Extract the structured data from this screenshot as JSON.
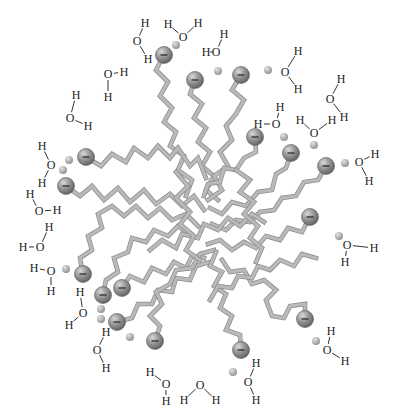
{
  "diagram": {
    "colors": {
      "background": "#ffffff",
      "chain_fill": "#b9b9b9",
      "chain_edge": "#8a8a8a",
      "headgroup": "#8c8c8c",
      "counterion": "#a8a8a8",
      "text": "#222222"
    },
    "labels": {
      "hydrogen": "H",
      "oxygen": "O",
      "charge": "−"
    },
    "headgroups": [
      {
        "x": 164,
        "y": 55
      },
      {
        "x": 195,
        "y": 80
      },
      {
        "x": 241,
        "y": 75
      },
      {
        "x": 86,
        "y": 157
      },
      {
        "x": 66,
        "y": 186
      },
      {
        "x": 255,
        "y": 137
      },
      {
        "x": 291,
        "y": 153
      },
      {
        "x": 326,
        "y": 166
      },
      {
        "x": 310,
        "y": 217
      },
      {
        "x": 83,
        "y": 274
      },
      {
        "x": 103,
        "y": 295
      },
      {
        "x": 122,
        "y": 288
      },
      {
        "x": 117,
        "y": 322
      },
      {
        "x": 155,
        "y": 341
      },
      {
        "x": 241,
        "y": 350
      },
      {
        "x": 305,
        "y": 319
      }
    ],
    "counterions": [
      {
        "x": 176,
        "y": 45
      },
      {
        "x": 218,
        "y": 71
      },
      {
        "x": 268,
        "y": 70
      },
      {
        "x": 69,
        "y": 160
      },
      {
        "x": 63,
        "y": 170
      },
      {
        "x": 284,
        "y": 137
      },
      {
        "x": 314,
        "y": 145
      },
      {
        "x": 345,
        "y": 163
      },
      {
        "x": 339,
        "y": 236
      },
      {
        "x": 66,
        "y": 269
      },
      {
        "x": 101,
        "y": 309
      },
      {
        "x": 101,
        "y": 319
      },
      {
        "x": 130,
        "y": 337
      },
      {
        "x": 233,
        "y": 372
      },
      {
        "x": 316,
        "y": 341
      }
    ],
    "waters": [
      {
        "o": [
          137,
          41
        ],
        "h1": [
          145,
          23
        ],
        "h2": [
          148,
          59
        ]
      },
      {
        "o": [
          183,
          37
        ],
        "h1": [
          168,
          24
        ],
        "h2": [
          198,
          23
        ]
      },
      {
        "o": [
          216,
          52
        ],
        "h1": [
          206,
          52
        ],
        "h2": [
          224,
          34
        ]
      },
      {
        "o": [
          108,
          74
        ],
        "h1": [
          124,
          72
        ],
        "h2": [
          108,
          97
        ]
      },
      {
        "o": [
          285,
          72
        ],
        "h1": [
          298,
          51
        ],
        "h2": [
          298,
          89
        ]
      },
      {
        "o": [
          70,
          118
        ],
        "h1": [
          76,
          95
        ],
        "h2": [
          88,
          126
        ]
      },
      {
        "o": [
          330,
          99
        ],
        "h1": [
          341,
          79
        ],
        "h2": [
          344,
          117
        ]
      },
      {
        "o": [
          276,
          124
        ],
        "h1": [
          280,
          107
        ],
        "h2": [
          258,
          124
        ]
      },
      {
        "o": [
          314,
          133
        ],
        "h1": [
          300,
          120
        ],
        "h2": [
          332,
          120
        ]
      },
      {
        "o": [
          51,
          165
        ],
        "h1": [
          42,
          146
        ],
        "h2": [
          42,
          183
        ]
      },
      {
        "o": [
          359,
          162
        ],
        "h1": [
          375,
          154
        ],
        "h2": [
          369,
          181
        ]
      },
      {
        "o": [
          39,
          211
        ],
        "h1": [
          30,
          194
        ],
        "h2": [
          57,
          210
        ]
      },
      {
        "o": [
          40,
          247
        ],
        "h1": [
          49,
          227
        ],
        "h2": [
          23,
          247
        ]
      },
      {
        "o": [
          347,
          245
        ],
        "h1": [
          374,
          248
        ],
        "h2": [
          345,
          262
        ]
      },
      {
        "o": [
          51,
          271
        ],
        "h1": [
          34,
          268
        ],
        "h2": [
          51,
          291
        ]
      },
      {
        "o": [
          83,
          313
        ],
        "h1": [
          80,
          292
        ],
        "h2": [
          69,
          325
        ]
      },
      {
        "o": [
          97,
          350
        ],
        "h1": [
          106,
          332
        ],
        "h2": [
          106,
          368
        ]
      },
      {
        "o": [
          327,
          350
        ],
        "h1": [
          331,
          331
        ],
        "h2": [
          345,
          361
        ]
      },
      {
        "o": [
          166,
          384
        ],
        "h1": [
          150,
          372
        ],
        "h2": [
          166,
          401
        ]
      },
      {
        "o": [
          200,
          385
        ],
        "h1": [
          184,
          400
        ],
        "h2": [
          216,
          400
        ]
      },
      {
        "o": [
          248,
          382
        ],
        "h1": [
          256,
          363
        ],
        "h2": [
          256,
          400
        ]
      }
    ],
    "chains": [
      "M164,55 L156,70 L168,82 L160,96 L172,108 L164,122 L176,132 L170,146 L184,156 L178,170 L192,180 L186,196",
      "M195,80 L190,94 L202,104 L194,118 L206,128 L198,142 L210,152 L202,166 L214,176 L206,190 L218,200",
      "M241,75 L232,90 L244,100 L236,114 L226,126 L232,140 L220,152 L228,166 L214,176 L222,190 L208,200",
      "M86,157 L101,166 L112,154 L126,162 L134,148 L148,158 L158,146 L170,158 L178,148 L190,166 L198,158 L206,178",
      "M66,186 L80,196 L92,186 L104,200 L118,188 L130,202 L144,190 L156,204 L170,194 L182,206 L194,196 L204,210",
      "M255,137 L256,152 L244,158 L236,170 L224,168 L220,182 L208,184 L204,196",
      "M291,153 L286,168 L276,174 L272,190 L258,192 L246,206 L232,202 L222,214 L210,208",
      "M326,166 L318,180 L304,182 L296,196 L282,198 L274,210 L260,212 L250,222 L236,220 L226,230 L212,224",
      "M310,217 L302,232 L288,228 L280,240 L266,236 L256,248 L244,242 L232,250 L220,240 L208,244",
      "M83,274 L80,258 L92,250 L88,236 L102,228 L98,214 L112,206 L124,216 L136,206 L148,218 L160,208 L172,220 L186,214 L198,226",
      "M103,295 L106,280 L118,272 L114,258 L128,252 L132,238 L146,242 L154,230 L168,236 L178,226 L190,234",
      "M122,288 L130,276 L144,282 L152,268 L166,274 L174,262 L186,268 L192,256 L204,258",
      "M117,322 L132,318 L138,304 L152,304 L158,290 L172,292 L176,278 L190,280 L196,266 L210,262",
      "M155,341 L160,326 L150,316 L162,304 L156,292 L170,284 L176,270 L192,268 L200,254 L214,250",
      "M241,350 L240,335 L226,330 L232,316 L220,308 L226,294 L214,286 L222,272 L210,266 L216,252",
      "M305,319 L305,304 L290,306 L284,318 L272,316 L266,300 L276,290 L264,280 L252,284 L244,270 L230,272 L222,260",
      "M210,300 L218,286 L232,288 L238,276 L252,278 L258,266 L270,270 L280,260 L294,266 L302,254 L316,258",
      "M150,250 L162,240 L176,248 L182,234 L198,238 L204,224 L218,230 L228,218 L240,226 L252,214 L264,222",
      "M176,172 L188,186 L176,198 L190,212 L180,224 L194,236 L186,250 L200,260",
      "M236,170 L250,180 L240,192 L254,202 L244,214 L258,226 L250,238 L262,248 L256,262"
    ]
  }
}
